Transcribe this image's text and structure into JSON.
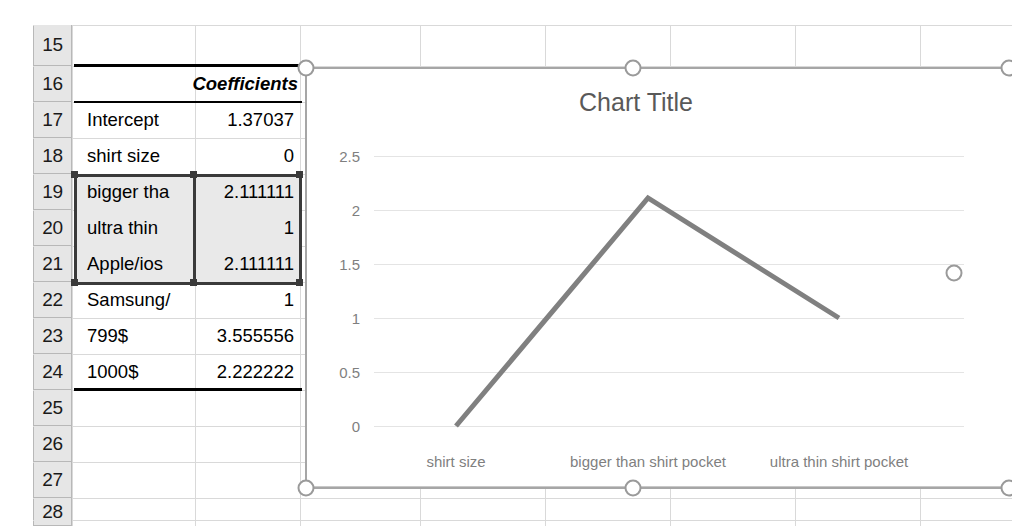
{
  "app": {
    "type": "spreadsheet",
    "accent_gray": "#7f7f7f",
    "line_color": "#808080",
    "header_fill": "#e6e6e6"
  },
  "sheet": {
    "row_headers": [
      "15",
      "16",
      "17",
      "18",
      "19",
      "20",
      "21",
      "22",
      "23",
      "24",
      "25",
      "26",
      "27",
      "28"
    ],
    "rows": [
      {
        "row": "15",
        "label": "",
        "value": ""
      },
      {
        "row": "16",
        "label": "Coefficients",
        "value": "",
        "is_header": true
      },
      {
        "row": "17",
        "label": "Intercept",
        "value": "1.37037"
      },
      {
        "row": "18",
        "label": "shirt size",
        "value": "0",
        "selected": true
      },
      {
        "row": "19",
        "label": "bigger tha",
        "value": "2.111111",
        "selected": true
      },
      {
        "row": "20",
        "label": "ultra thin",
        "value": "1",
        "selected": true
      },
      {
        "row": "21",
        "label": "Apple/ios",
        "value": "2.111111"
      },
      {
        "row": "22",
        "label": "Samsung/",
        "value": "1"
      },
      {
        "row": "23",
        "label": "799$",
        "value": "3.555556"
      },
      {
        "row": "24",
        "label": "1000$",
        "value": "2.222222"
      },
      {
        "row": "25",
        "label": "",
        "value": ""
      },
      {
        "row": "26",
        "label": "",
        "value": ""
      },
      {
        "row": "27",
        "label": "",
        "value": ""
      },
      {
        "row": "28",
        "label": "",
        "value": ""
      }
    ]
  },
  "chart_data": {
    "type": "line",
    "title": "Chart Title",
    "categories": [
      "shirt size",
      "bigger than shirt pocket",
      "ultra thin shirt pocket"
    ],
    "values": [
      0,
      2.111111,
      1
    ],
    "series": [
      {
        "name": "Coefficients",
        "values": [
          0,
          2.111111,
          1
        ]
      }
    ],
    "xlabel": "",
    "ylabel": "",
    "ylim": [
      0,
      2.5
    ],
    "yticks": [
      "0",
      "0.5",
      "1",
      "1.5",
      "2",
      "2.5"
    ],
    "ytick_values": [
      0,
      0.5,
      1,
      1.5,
      2,
      2.5
    ],
    "grid": true,
    "legend": "none",
    "line_color": "#808080"
  },
  "chart_object": {
    "selected": true,
    "handle_name": "resize-handle"
  }
}
